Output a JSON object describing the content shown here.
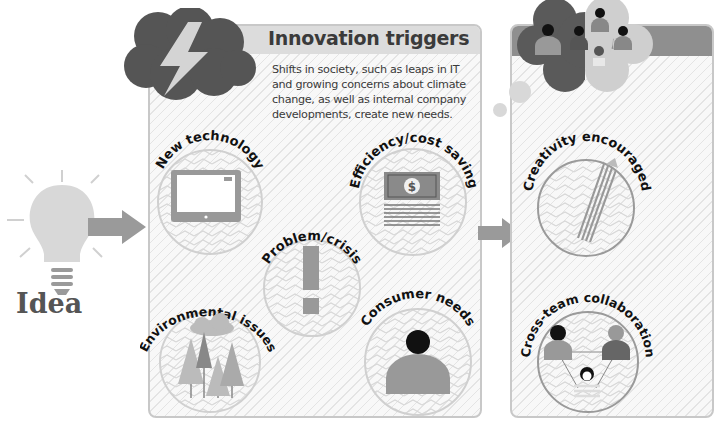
{
  "idea": {
    "label": "Idea",
    "icon": "lightbulb-icon"
  },
  "innovation_triggers": {
    "title": "Innovation triggers",
    "description_lines": [
      "Shifts in society, such as leaps in IT",
      "and growing concerns about climate",
      "change, as well as internal company",
      "developments, create new needs."
    ],
    "icon": "lightning-cloud-icon",
    "items": [
      {
        "label": "New technology",
        "icon": "tablet-icon"
      },
      {
        "label": "Efficiency/cost saving",
        "icon": "money-icon"
      },
      {
        "label": "Problem/crisis",
        "icon": "exclamation-icon"
      },
      {
        "label": "Environmental issues",
        "icon": "trees-icon"
      },
      {
        "label": "Consumer needs",
        "icon": "person-icon"
      }
    ]
  },
  "next_stage": {
    "icon": "team-thought-cloud-icon",
    "items": [
      {
        "label": "Creativity encouraged",
        "icon": "pencil-icon"
      },
      {
        "label": "Cross-team collaboration",
        "icon": "team-network-icon"
      }
    ]
  },
  "colors": {
    "panel_border": "#c8c8c8",
    "panel_header": "#dcdcdc",
    "cloud_dark": "#555555",
    "arrow": "#9a9a9a",
    "bulb": "#d8d8d8",
    "text": "#3a3a3a"
  }
}
